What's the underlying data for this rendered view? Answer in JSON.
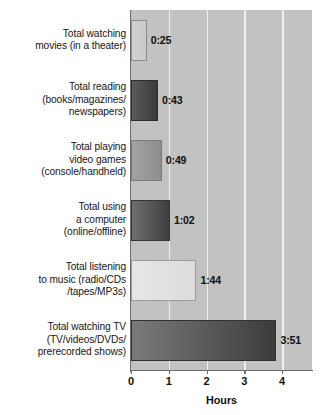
{
  "chart_data": {
    "type": "bar",
    "orientation": "horizontal",
    "title": "",
    "xlabel": "Hours",
    "ylabel": "",
    "xlim": [
      0,
      4.79
    ],
    "xticks": [
      0,
      1,
      2,
      3,
      4
    ],
    "xtick_labels": [
      "0",
      "1",
      "2",
      "3",
      "4"
    ],
    "grid": true,
    "grid_axis": "x",
    "legend": false,
    "categories": [
      "Total watching movies (in a theater)",
      "Total reading (books/magazines/newspapers)",
      "Total playing video games (console/handheld)",
      "Total using a computer (online/offline)",
      "Total listening to music (radio/CDs/tapes/MP3s)",
      "Total watching TV (TV/videos/DVDs/prerecorded shows)"
    ],
    "category_lines": [
      [
        "Total watching",
        "movies (in a theater)"
      ],
      [
        "Total reading",
        "(books/magazines/",
        "newspapers)"
      ],
      [
        "Total playing",
        "video games",
        "(console/handheld)"
      ],
      [
        "Total using",
        "a computer",
        "(online/offline)"
      ],
      [
        "Total listening",
        "to music (radio/CDs",
        "/tapes/MP3s)"
      ],
      [
        "Total watching TV",
        "(TV/videos/DVDs/",
        "prerecorded shows)"
      ]
    ],
    "data_labels": [
      "0:25",
      "0:43",
      "0:49",
      "1:02",
      "1:44",
      "3:51"
    ],
    "values_hours": [
      0.4167,
      0.7167,
      0.8167,
      1.0333,
      1.7333,
      3.85
    ],
    "bar_colors": [
      "#cdcdcd",
      "#4a4a4a",
      "#989898",
      "#555555",
      "#e1e1e1",
      "#5b5b5b"
    ],
    "plot_background": "#c2c2c2",
    "gridline_color": "#efefef",
    "axis_color": "#6e6e6e"
  },
  "axis": {
    "x_title": "Hours"
  }
}
